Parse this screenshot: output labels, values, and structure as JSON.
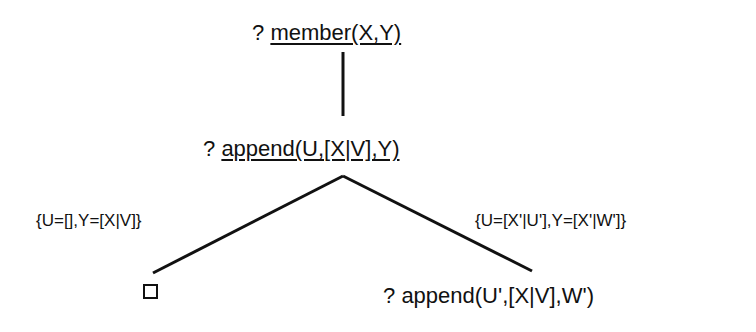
{
  "diagram": {
    "type": "SLD resolution tree",
    "root": {
      "prefix": "?",
      "goal": "member(X,Y)",
      "underlined": true
    },
    "level1": {
      "prefix": "?",
      "goal": "append(U,[X|V],Y)",
      "underlined": true
    },
    "branches": [
      {
        "substitution": "{U=[],Y=[X|V]}",
        "result": "empty clause (success)",
        "result_symbol": "□"
      },
      {
        "substitution": "{U=[X'|U'],Y=[X'|W']}",
        "result_prefix": "?",
        "result": "append(U',[X|V],W')"
      }
    ]
  }
}
